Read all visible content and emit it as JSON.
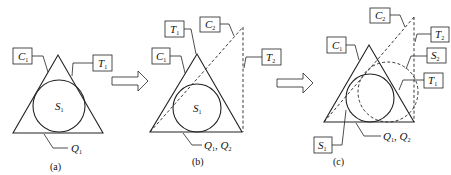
{
  "figure": {
    "panels": [
      {
        "id": "a",
        "caption": "(a)",
        "labels": {
          "C1": {
            "main": "C",
            "sub": "1"
          },
          "T1": {
            "main": "T",
            "sub": "1"
          },
          "S1": {
            "main": "S",
            "sub": "1"
          },
          "Q": {
            "text": "Q",
            "sub": "1"
          }
        }
      },
      {
        "id": "b",
        "caption": "(b)",
        "labels": {
          "T1": {
            "main": "T",
            "sub": "1"
          },
          "C2": {
            "main": "C",
            "sub": "2"
          },
          "C1": {
            "main": "C",
            "sub": "1"
          },
          "T2": {
            "main": "T",
            "sub": "2"
          },
          "S1": {
            "main": "S",
            "sub": "1"
          },
          "Q": {
            "q1": "Q",
            "q1sub": "1",
            "sep": ", ",
            "q2": "Q",
            "q2sub": "2"
          }
        }
      },
      {
        "id": "c",
        "caption": "(c)",
        "labels": {
          "C2": {
            "main": "C",
            "sub": "2"
          },
          "C1": {
            "main": "C",
            "sub": "1"
          },
          "T2": {
            "main": "T",
            "sub": "2"
          },
          "S2": {
            "main": "S",
            "sub": "2"
          },
          "T1": {
            "main": "T",
            "sub": "1"
          },
          "S1": {
            "main": "S",
            "sub": "1"
          },
          "Q": {
            "q1": "Q",
            "q1sub": "1",
            "sep": ", ",
            "q2": "Q",
            "q2sub": "2"
          }
        }
      }
    ],
    "arrows": [
      {
        "from": "a",
        "to": "b",
        "icon": "right-hollow-arrow-icon"
      },
      {
        "from": "b",
        "to": "c",
        "icon": "right-hollow-arrow-icon"
      }
    ],
    "colors": {
      "stroke": "#222222",
      "background": "#ffffff"
    }
  }
}
